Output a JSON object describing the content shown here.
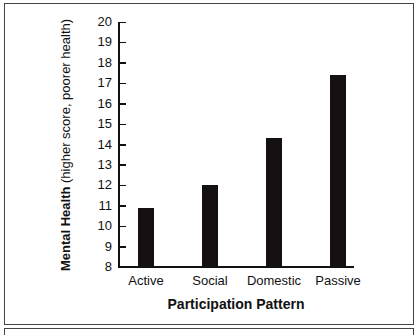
{
  "chart_data": {
    "type": "bar",
    "title": "",
    "xlabel": "Participation Pattern",
    "ylabel_bold": "Mental Health",
    "ylabel_rest": " (higher score, poorer health)",
    "ylabel": "Mental Health (higher score, poorer health)",
    "categories": [
      "Active",
      "Social",
      "Domestic",
      "Passive"
    ],
    "values": [
      10.9,
      12.0,
      14.3,
      17.4
    ],
    "ylim": [
      8,
      20
    ],
    "yticks": [
      8,
      9,
      10,
      11,
      12,
      13,
      14,
      15,
      16,
      17,
      18,
      19,
      20
    ],
    "grid": false,
    "legend": null,
    "bar_color": "#141110"
  }
}
